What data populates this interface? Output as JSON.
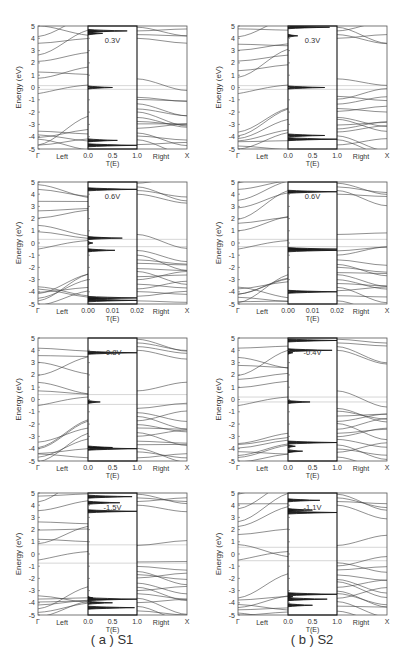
{
  "figure": {
    "captions": {
      "a": "( a ) S1",
      "b": "( b ) S2"
    },
    "y_axis_label": "Energy (eV)",
    "x_axis_label_middle": "T(E)",
    "left_label": "Left",
    "right_label": "Right",
    "gamma_label": "Γ",
    "x_point_label": "X"
  },
  "chart_data": [
    {
      "id": "S1-0.3V",
      "column": "S1",
      "row": 0,
      "type": "line",
      "title": "0.3V",
      "bias": "0.3V",
      "ylabel": "Energy (eV)",
      "ylim": [
        -5,
        5
      ],
      "yticks": [
        5,
        4,
        3,
        2,
        1,
        0,
        -1,
        -2,
        -3,
        -4,
        -5
      ],
      "xlabel": "T(E)",
      "xlim": [
        0,
        1.0
      ],
      "xticks": [
        "0.0",
        "0.5",
        "1.0"
      ],
      "panels": [
        "Left",
        "T(E)",
        "Right"
      ],
      "bias_window": [
        -0.15,
        0.15
      ],
      "transmission_peaks": [
        {
          "E": 4.6,
          "T": 0.8
        },
        {
          "E": 4.4,
          "T": 0.3
        },
        {
          "E": 0.0,
          "T": 0.5
        },
        {
          "E": -4.3,
          "T": 0.6
        },
        {
          "E": -4.7,
          "T": 1.0
        }
      ]
    },
    {
      "id": "S2-0.3V",
      "column": "S2",
      "row": 0,
      "type": "line",
      "title": "0.3V",
      "bias": "0.3V",
      "ylabel": "Energy (eV)",
      "ylim": [
        -5,
        5
      ],
      "yticks": [
        5,
        4,
        3,
        2,
        1,
        0,
        -1,
        -2,
        -3,
        -4,
        -5
      ],
      "xlabel": "T(E)",
      "xlim": [
        0,
        1.0
      ],
      "xticks": [
        "0.0",
        "0.5",
        "1.0"
      ],
      "panels": [
        "Left",
        "T(E)",
        "Right"
      ],
      "bias_window": [
        -0.15,
        0.15
      ],
      "transmission_peaks": [
        {
          "E": 4.9,
          "T": 0.85
        },
        {
          "E": 4.2,
          "T": 0.2
        },
        {
          "E": 0.0,
          "T": 0.75
        },
        {
          "E": -3.9,
          "T": 0.75
        },
        {
          "E": -4.2,
          "T": 1.0
        }
      ]
    },
    {
      "id": "S1-0.6V",
      "column": "S1",
      "row": 1,
      "type": "line",
      "title": "0.6V",
      "bias": "0.6V",
      "ylabel": "Energy (eV)",
      "ylim": [
        -5,
        5
      ],
      "yticks": [
        5,
        4,
        3,
        2,
        1,
        0,
        -1,
        -2,
        -3,
        -4,
        -5
      ],
      "xlabel": "T(E)",
      "xlim": [
        0,
        0.02
      ],
      "xticks": [
        "0.00",
        "0.01",
        "0.02"
      ],
      "panels": [
        "Left",
        "T(E)",
        "Right"
      ],
      "bias_window": [
        -0.3,
        0.3
      ],
      "transmission_peaks": [
        {
          "E": 4.4,
          "T": 0.02
        },
        {
          "E": 0.4,
          "T": 0.014
        },
        {
          "E": 0.0,
          "T": 0.002
        },
        {
          "E": -0.6,
          "T": 0.011
        },
        {
          "E": -4.5,
          "T": 0.02
        },
        {
          "E": -4.7,
          "T": 0.02
        }
      ]
    },
    {
      "id": "S2-0.6V",
      "column": "S2",
      "row": 1,
      "type": "line",
      "title": "0.6V",
      "bias": "0.6V",
      "ylabel": "Energy (eV)",
      "ylim": [
        -5,
        5
      ],
      "yticks": [
        5,
        4,
        3,
        2,
        1,
        0,
        -1,
        -2,
        -3,
        -4,
        -5
      ],
      "xlabel": "T(E)",
      "xlim": [
        0,
        0.02
      ],
      "xticks": [
        "0.00",
        "0.01",
        "0.02"
      ],
      "panels": [
        "Left",
        "T(E)",
        "Right"
      ],
      "bias_window": [
        -0.3,
        0.3
      ],
      "transmission_peaks": [
        {
          "E": 4.2,
          "T": 0.02
        },
        {
          "E": -0.5,
          "T": 0.02
        },
        {
          "E": -0.6,
          "T": 0.02
        },
        {
          "E": -4.0,
          "T": 0.02
        }
      ]
    },
    {
      "id": "S1--0.8V",
      "column": "S1",
      "row": 2,
      "type": "line",
      "title": "-0.8V",
      "bias": "-0.8V",
      "ylabel": "Energy (eV)",
      "ylim": [
        -5,
        5
      ],
      "yticks": [
        5,
        4,
        3,
        2,
        1,
        0,
        -1,
        -2,
        -3,
        -4,
        -5
      ],
      "xlabel": "T(E)",
      "xlim": [
        0,
        1.0
      ],
      "xticks": [
        "0.0",
        "0.5",
        "1.0"
      ],
      "panels": [
        "Left",
        "T(E)",
        "Right"
      ],
      "bias_window": [
        -0.4,
        0.4
      ],
      "transmission_peaks": [
        {
          "E": 3.8,
          "T": 1.0
        },
        {
          "E": -0.2,
          "T": 0.25
        },
        {
          "E": -3.9,
          "T": 0.5
        },
        {
          "E": -4.0,
          "T": 1.0
        }
      ]
    },
    {
      "id": "S2--0.4V",
      "column": "S2",
      "row": 2,
      "type": "line",
      "title": "-0.4V",
      "bias": "-0.4V",
      "ylabel": "Energy (eV)",
      "ylim": [
        -5,
        5
      ],
      "yticks": [
        5,
        4,
        3,
        2,
        1,
        0,
        -1,
        -2,
        -3,
        -4,
        -5
      ],
      "xlabel": "T(E)",
      "xlim": [
        0,
        1.0
      ],
      "xticks": [
        "0.0",
        "0.5",
        "1.0"
      ],
      "panels": [
        "Left",
        "T(E)",
        "Right"
      ],
      "bias_window": [
        -0.2,
        0.2
      ],
      "transmission_peaks": [
        {
          "E": 4.8,
          "T": 1.0
        },
        {
          "E": 4.0,
          "T": 0.9
        },
        {
          "E": 3.8,
          "T": 0.1
        },
        {
          "E": -0.2,
          "T": 0.45
        },
        {
          "E": -3.5,
          "T": 1.0
        },
        {
          "E": -3.8,
          "T": 0.15
        },
        {
          "E": -4.2,
          "T": 0.3
        }
      ]
    },
    {
      "id": "S1--1.5V",
      "column": "S1",
      "row": 3,
      "type": "line",
      "title": "-1.5V",
      "bias": "-1.5V",
      "ylabel": "Energy (eV)",
      "ylim": [
        -5,
        5
      ],
      "yticks": [
        5,
        4,
        3,
        2,
        1,
        0,
        -1,
        -2,
        -3,
        -4,
        -5
      ],
      "xlabel": "T(E)",
      "xlim": [
        0,
        1.0
      ],
      "xticks": [
        "0.0",
        "0.5",
        "1.0"
      ],
      "panels": [
        "Left",
        "T(E)",
        "Right"
      ],
      "bias_window": [
        -0.75,
        0.75
      ],
      "transmission_peaks": [
        {
          "E": 4.7,
          "T": 0.9
        },
        {
          "E": 4.2,
          "T": 0.65
        },
        {
          "E": 3.5,
          "T": 1.0
        },
        {
          "E": -3.6,
          "T": 0.1
        },
        {
          "E": -3.7,
          "T": 1.0
        },
        {
          "E": -4.0,
          "T": 0.5
        },
        {
          "E": -4.4,
          "T": 0.95
        }
      ]
    },
    {
      "id": "S2--1.1V",
      "column": "S2",
      "row": 3,
      "type": "line",
      "title": "-1.1V",
      "bias": "-1.1V",
      "ylabel": "Energy (eV)",
      "ylim": [
        -5,
        5
      ],
      "yticks": [
        5,
        4,
        3,
        2,
        1,
        0,
        -1,
        -2,
        -3,
        -4,
        -5
      ],
      "xlabel": "T(E)",
      "xlim": [
        0,
        1.0
      ],
      "xticks": [
        "0.0",
        "0.5",
        "1.0"
      ],
      "panels": [
        "Left",
        "T(E)",
        "Right"
      ],
      "bias_window": [
        -0.55,
        0.55
      ],
      "transmission_peaks": [
        {
          "E": 4.4,
          "T": 0.65
        },
        {
          "E": 3.6,
          "T": 0.5
        },
        {
          "E": 3.4,
          "T": 1.0
        },
        {
          "E": -3.3,
          "T": 1.0
        },
        {
          "E": -3.5,
          "T": 0.1
        },
        {
          "E": -3.7,
          "T": 0.8
        },
        {
          "E": -4.2,
          "T": 0.5
        }
      ]
    }
  ]
}
